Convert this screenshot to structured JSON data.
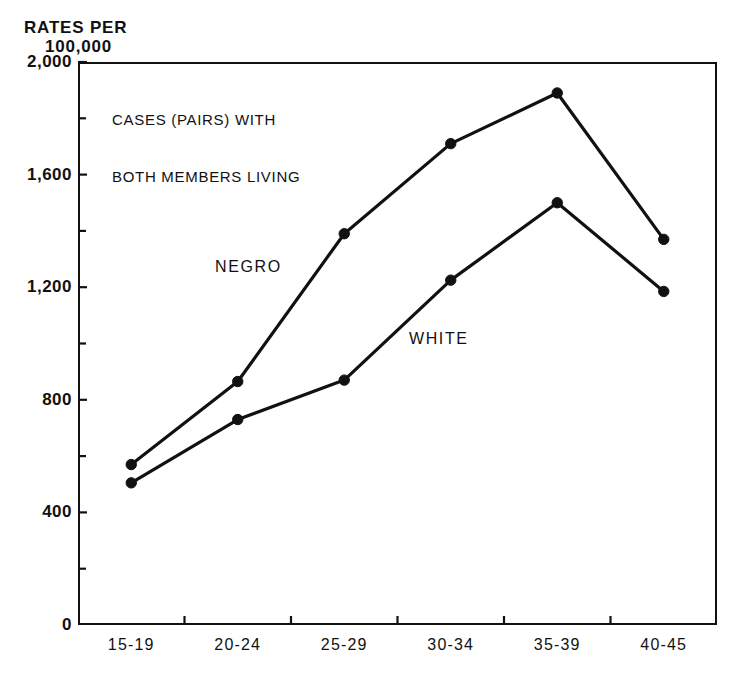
{
  "chart_data": {
    "type": "line",
    "title": "CASES (PAIRS) WITH BOTH MEMBERS LIVING",
    "annotation_line1": "CASES (PAIRS) WITH",
    "annotation_line2": "BOTH MEMBERS LIVING",
    "ylabel_line1": "RATES PER",
    "ylabel_line2": "100,000",
    "xlabel": "",
    "categories": [
      "15-19",
      "20-24",
      "25-29",
      "30-34",
      "35-39",
      "40-45"
    ],
    "series": [
      {
        "name": "NEGRO",
        "values": [
          570,
          865,
          1390,
          1710,
          1890,
          1370
        ],
        "color": "#111111",
        "marker": "filled-circle"
      },
      {
        "name": "WHITE",
        "values": [
          505,
          730,
          870,
          1225,
          1500,
          1185
        ],
        "color": "#111111",
        "marker": "filled-circle"
      }
    ],
    "ylim": [
      0,
      2000
    ],
    "ytick_labels": [
      "2,000",
      "1,600",
      "1,200",
      "800",
      "400",
      "0"
    ],
    "ytick_values": [
      2000,
      1600,
      1200,
      800,
      400,
      0
    ],
    "yminor_interval": 200,
    "grid": false,
    "legend_position": "inline-labels",
    "axis_color": "#111111",
    "background_color": "#ffffff"
  },
  "axis_unit": {
    "line1": "RATES PER",
    "line2": "100,000"
  }
}
